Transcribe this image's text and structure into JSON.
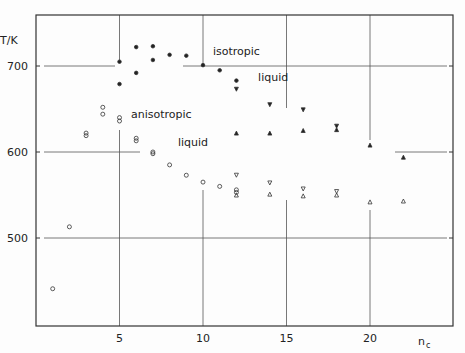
{
  "chart_data": {
    "type": "scatter",
    "title": "",
    "xlabel": "n_c",
    "ylabel": "T/K",
    "xlim": [
      0,
      25
    ],
    "ylim": [
      398,
      760
    ],
    "x_ticks": [
      5,
      10,
      15,
      20
    ],
    "y_ticks": [
      500,
      600,
      700
    ],
    "grid": "partial",
    "annotations": [
      {
        "text": "isotropic",
        "x": 12.0,
        "y": 713
      },
      {
        "text": "liquid",
        "x": 14.2,
        "y": 683
      },
      {
        "text": "anisotropic",
        "x": 7.5,
        "y": 640
      },
      {
        "text": "liquid",
        "x": 9.4,
        "y": 607
      }
    ],
    "series": [
      {
        "name": "open circles",
        "marker": "open-circle",
        "points": [
          [
            1,
            441
          ],
          [
            2,
            513
          ],
          [
            3,
            622
          ],
          [
            3,
            619
          ],
          [
            4,
            652
          ],
          [
            4,
            644
          ],
          [
            5,
            640
          ],
          [
            5,
            636
          ],
          [
            6,
            616
          ],
          [
            6,
            613
          ],
          [
            7,
            600
          ],
          [
            7,
            598
          ],
          [
            8,
            585
          ],
          [
            9,
            573
          ],
          [
            10,
            565
          ],
          [
            11,
            560
          ],
          [
            12,
            556
          ],
          [
            12,
            553
          ]
        ]
      },
      {
        "name": "filled circles",
        "marker": "filled-circle",
        "points": [
          [
            5,
            705
          ],
          [
            5,
            679
          ],
          [
            6,
            722
          ],
          [
            6,
            692
          ],
          [
            7,
            723
          ],
          [
            7,
            707
          ],
          [
            8,
            713
          ],
          [
            9,
            712
          ],
          [
            10,
            701
          ],
          [
            11,
            695
          ],
          [
            12,
            683
          ]
        ]
      },
      {
        "name": "filled down-triangles",
        "marker": "filled-down-triangle",
        "points": [
          [
            12,
            673
          ],
          [
            14,
            655
          ],
          [
            16,
            649
          ],
          [
            18,
            630
          ]
        ]
      },
      {
        "name": "filled up-triangles",
        "marker": "filled-up-triangle",
        "points": [
          [
            12,
            622
          ],
          [
            14,
            622
          ],
          [
            16,
            625
          ],
          [
            18,
            626
          ],
          [
            20,
            608
          ],
          [
            22,
            594
          ]
        ]
      },
      {
        "name": "open down-triangles",
        "marker": "open-down-triangle",
        "points": [
          [
            12,
            573
          ],
          [
            14,
            564
          ],
          [
            16,
            557
          ],
          [
            18,
            554
          ]
        ]
      },
      {
        "name": "open up-triangles",
        "marker": "open-up-triangle",
        "points": [
          [
            12,
            550
          ],
          [
            14,
            551
          ],
          [
            16,
            549
          ],
          [
            18,
            550
          ],
          [
            20,
            542
          ],
          [
            22,
            543
          ]
        ]
      }
    ]
  }
}
